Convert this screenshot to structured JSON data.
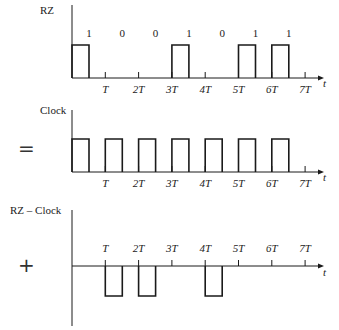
{
  "plots": [
    {
      "id": "rz",
      "label": "RZ",
      "operator": "",
      "bits": [
        "1",
        "0",
        "0",
        "1",
        "0",
        "1",
        "1"
      ],
      "pulses": [
        0,
        3,
        5,
        6
      ],
      "polarity": "positive",
      "ticks": [
        "T",
        "2T",
        "3T",
        "4T",
        "5T",
        "6T",
        "7T"
      ],
      "axis_label": "t"
    },
    {
      "id": "clock",
      "label": "Clock",
      "operator": "=",
      "pulses": [
        0,
        1,
        2,
        3,
        4,
        5,
        6
      ],
      "polarity": "positive",
      "ticks": [
        "T",
        "2T",
        "3T",
        "4T",
        "5T",
        "6T",
        "7T"
      ],
      "axis_label": "t"
    },
    {
      "id": "rz-minus-clock",
      "label": "RZ – Clock",
      "operator": "+",
      "pulses": [
        1,
        2,
        4
      ],
      "polarity": "negative",
      "ticks": [
        "T",
        "2T",
        "3T",
        "4T",
        "5T",
        "6T",
        "7T"
      ],
      "axis_label": "t"
    }
  ],
  "colors": {
    "line": "#1a1a1a",
    "text": "#222222"
  }
}
